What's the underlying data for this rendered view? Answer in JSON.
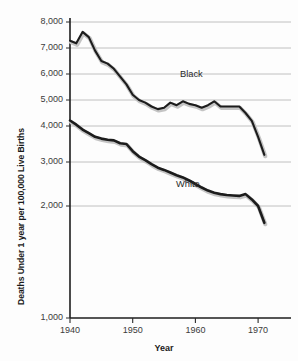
{
  "chart_data": {
    "type": "line",
    "title": "",
    "xlabel": "Year",
    "ylabel": "Deaths Under 1 year per 100,000 Live Births",
    "xlim": [
      1940,
      1973
    ],
    "ylim": [
      1000,
      8000
    ],
    "grid": true,
    "legend_position": "inline-labels",
    "x_ticks": [
      "1940",
      "1950",
      "1960",
      "1970"
    ],
    "x_tick_values": [
      1940,
      1950,
      1960,
      1970
    ],
    "y_ticks": [
      "1,000",
      "2,000",
      "3,000",
      "4,000",
      "5,000",
      "6,000",
      "7,000",
      "8,000"
    ],
    "y_tick_values": [
      1000,
      2000,
      3000,
      4000,
      5000,
      6000,
      7000,
      8000
    ],
    "series": [
      {
        "name": "Black",
        "color": "#1c1c1c",
        "label_text": "Black",
        "x": [
          1940,
          1941,
          1942,
          1943,
          1944,
          1945,
          1946,
          1947,
          1948,
          1949,
          1950,
          1951,
          1952,
          1953,
          1954,
          1955,
          1956,
          1957,
          1958,
          1959,
          1960,
          1961,
          1962,
          1963,
          1964,
          1965,
          1966,
          1967,
          1968,
          1969,
          1970,
          1971
        ],
        "values": [
          7280,
          7180,
          7620,
          7420,
          6900,
          6500,
          6400,
          6200,
          5900,
          5600,
          5200,
          5000,
          4900,
          4750,
          4650,
          4700,
          4900,
          4800,
          4950,
          4850,
          4800,
          4700,
          4800,
          4950,
          4750,
          4750,
          4750,
          4750,
          4500,
          4200,
          3700,
          3200
        ]
      },
      {
        "name": "White",
        "color": "#1c1c1c",
        "label_text": "White",
        "x": [
          1940,
          1941,
          1942,
          1943,
          1944,
          1945,
          1946,
          1947,
          1948,
          1949,
          1950,
          1951,
          1952,
          1953,
          1954,
          1955,
          1956,
          1957,
          1958,
          1959,
          1960,
          1961,
          1962,
          1963,
          1964,
          1965,
          1966,
          1967,
          1968,
          1969,
          1970,
          1971
        ],
        "values": [
          4210,
          4050,
          3900,
          3800,
          3700,
          3650,
          3620,
          3600,
          3520,
          3500,
          3300,
          3150,
          3050,
          2950,
          2870,
          2820,
          2760,
          2700,
          2650,
          2580,
          2500,
          2420,
          2350,
          2300,
          2270,
          2250,
          2240,
          2230,
          2270,
          2150,
          2000,
          1850
        ]
      }
    ]
  }
}
